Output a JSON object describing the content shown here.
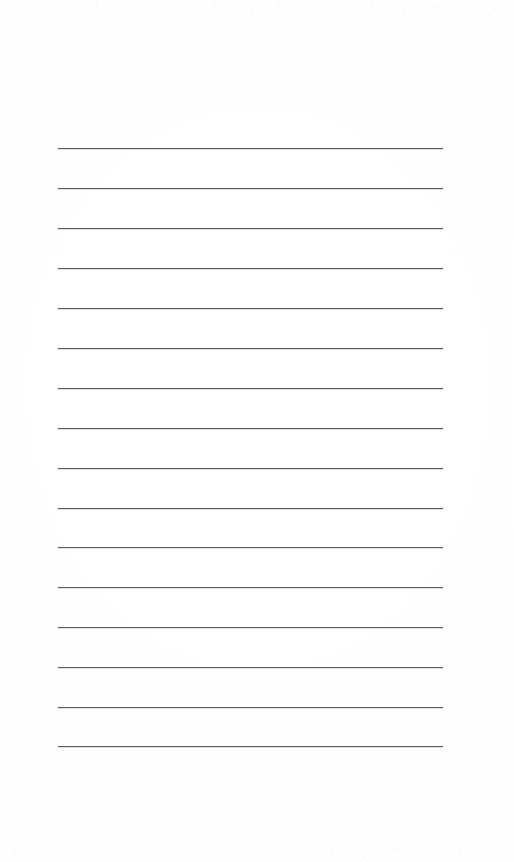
{
  "document": {
    "kind": "scanned-lined-paper",
    "title": "Blank ruled notebook page",
    "page_width": 514,
    "page_height": 862,
    "background_color": "#fefefe",
    "has_text": false,
    "written_content": "",
    "visible_text_items": []
  },
  "ruling": {
    "line_color": "#5c5c5c",
    "line_thickness_px": 1,
    "line_count": 16,
    "left_margin_px": 58,
    "right_edge_px": 443,
    "line_length_px": 385,
    "first_line_y_px": 148,
    "last_line_y_px": 746,
    "line_spacing_px": 39.9,
    "line_y_positions": [
      148,
      188,
      228,
      268,
      308,
      348,
      388,
      428,
      468,
      508,
      547,
      587,
      627,
      667,
      707,
      746
    ]
  },
  "margins": {
    "top_blank_px": 148,
    "bottom_blank_px": 116,
    "left_blank_px": 58,
    "right_blank_px": 71
  },
  "scan_artifacts": {
    "top_speckle_band_height_px": 46,
    "bottom_speckle_band_height_px": 72,
    "speckle_color": "rgba(0,0,0,0.05)"
  }
}
